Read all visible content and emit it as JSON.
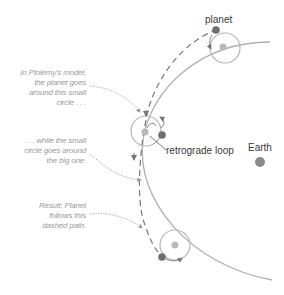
{
  "diagram": {
    "labels": {
      "planet": "planet",
      "retrograde": "retrograde loop",
      "earth": "Earth"
    },
    "annotations": {
      "note1": [
        "In Ptolemy's model,",
        "the planet goes",
        "around this small",
        "circle . . ."
      ],
      "note2": [
        ". . . while the small",
        "circle goes around",
        "the big one."
      ],
      "note3": [
        "Result: Planet",
        "follows this",
        "dashed path."
      ]
    },
    "colors": {
      "deferent": "#b0b0b0",
      "epicycle": "#b5b5b5",
      "planet": "#6e6e6e",
      "epicycle_center": "#b9b9b9",
      "earth": "#8a8a8a",
      "dashed_path": "#777777",
      "note_text": "#9a9a9a",
      "label_text": "#3a3a3a"
    }
  }
}
